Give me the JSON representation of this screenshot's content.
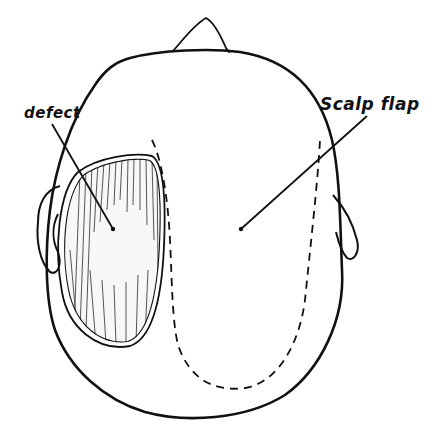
{
  "diagram": {
    "type": "anatomical illustration",
    "view": "top view of head",
    "labels": {
      "defect": "defect",
      "scalp_flap": "Scalp flap"
    },
    "colors": {
      "line": "#111111",
      "background": "#ffffff"
    }
  }
}
